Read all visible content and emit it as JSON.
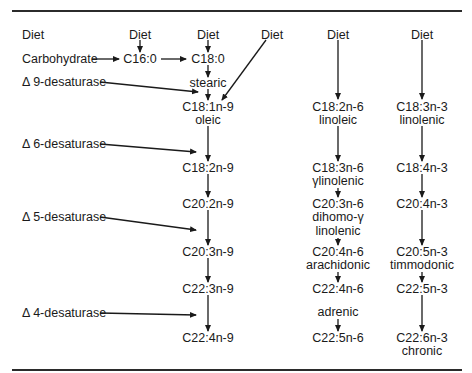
{
  "diagram": {
    "type": "metabolic-pathway",
    "source_labels": {
      "diet_left": "Diet",
      "diet_c16": "Diet",
      "diet_c18": "Diet",
      "diet_oblique": "Diet",
      "diet_n6": "Diet",
      "diet_n3": "Diet",
      "carbohydrate": "Carbohydrate"
    },
    "enzymes": [
      {
        "id": "d9",
        "label": "Δ 9-desaturase"
      },
      {
        "id": "d6",
        "label": "Δ 6-desaturase"
      },
      {
        "id": "d5",
        "label": "Δ 5-desaturase"
      },
      {
        "id": "d4",
        "label": "Δ 4-desaturase"
      }
    ],
    "saturated": {
      "c16": "C16:0",
      "c18": "C18:0",
      "c18_name": "stearic"
    },
    "n9_series": [
      {
        "formula": "C18:1n-9",
        "name": "oleic"
      },
      {
        "formula": "C18:2n-9",
        "name": ""
      },
      {
        "formula": "C20:2n-9",
        "name": ""
      },
      {
        "formula": "C20:3n-9",
        "name": ""
      },
      {
        "formula": "C22:3n-9",
        "name": ""
      },
      {
        "formula": "C22:4n-9",
        "name": ""
      }
    ],
    "n6_series": [
      {
        "formula": "C18:2n-6",
        "name": "linoleic"
      },
      {
        "formula": "C18:3n-6",
        "name": "γlinolenic"
      },
      {
        "formula": "C20:3n-6",
        "name": "dihomo-γ",
        "name2": "linolenic"
      },
      {
        "formula": "C20:4n-6",
        "name": "arachidonic"
      },
      {
        "formula": "C22:4n-6",
        "name": "adrenic",
        "name_position": "below"
      },
      {
        "formula": "C22:5n-6",
        "name": ""
      }
    ],
    "n3_series": [
      {
        "formula": "C18:3n-3",
        "name": "linolenic"
      },
      {
        "formula": "C18:4n-3",
        "name": ""
      },
      {
        "formula": "C20:4n-3",
        "name": ""
      },
      {
        "formula": "C20:5n-3",
        "name": "timmodonic"
      },
      {
        "formula": "C22:5n-3",
        "name": ""
      },
      {
        "formula": "C22:6n-3",
        "name": "chronic"
      }
    ],
    "colors": {
      "ink": "#1a1a1a",
      "rule": "#2b2b2b",
      "background": "#ffffff"
    }
  }
}
